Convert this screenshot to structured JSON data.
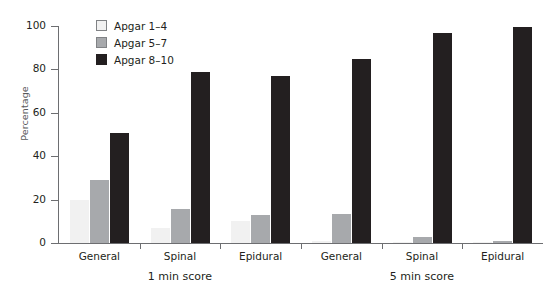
{
  "chart_data": {
    "type": "bar",
    "title": "",
    "xlabel": "",
    "ylabel": "Percentage",
    "ylim": [
      0,
      100
    ],
    "yticks": [
      0,
      20,
      40,
      60,
      80,
      100
    ],
    "grid": false,
    "legend_position": "top-left",
    "categories": [
      "General",
      "Spinal",
      "Epidural",
      "General",
      "Spinal",
      "Epidural"
    ],
    "sections": [
      {
        "label": "1 min score",
        "categories": [
          "General",
          "Spinal",
          "Epidural"
        ]
      },
      {
        "label": "5 min score",
        "categories": [
          "General",
          "Spinal",
          "Epidural"
        ]
      }
    ],
    "series": [
      {
        "name": "Apgar 1–4",
        "color": "#f1f1f1",
        "values": [
          20,
          7,
          10,
          1,
          0.5,
          0.5
        ]
      },
      {
        "name": "Apgar 5–7",
        "color": "#a7a9ac",
        "values": [
          29,
          15.5,
          13,
          13.5,
          3,
          1
        ]
      },
      {
        "name": "Apgar 8–10",
        "color": "#231f20",
        "values": [
          50.5,
          79,
          77,
          85,
          97,
          99.5
        ]
      }
    ]
  },
  "legend": {
    "items": [
      {
        "label": "Apgar 1–4"
      },
      {
        "label": "Apgar 5–7"
      },
      {
        "label": "Apgar 8–10"
      }
    ]
  },
  "axes": {
    "y_label": "Percentage",
    "y_ticks": [
      "0",
      "20",
      "40",
      "60",
      "80",
      "100"
    ],
    "x_group_labels": [
      "General",
      "Spinal",
      "Epidural",
      "General",
      "Spinal",
      "Epidural"
    ],
    "x_section_labels": [
      "1 min score",
      "5 min score"
    ]
  }
}
